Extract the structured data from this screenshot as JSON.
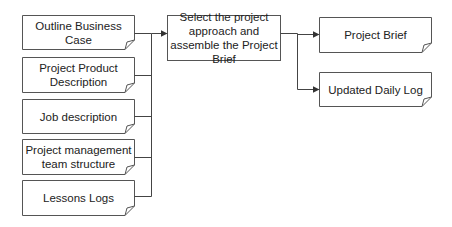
{
  "diagram": {
    "inputs": [
      {
        "label": "Outline Business Case"
      },
      {
        "label": "Project Product Description"
      },
      {
        "label": "Job description"
      },
      {
        "label": "Project management team structure"
      },
      {
        "label": "Lessons Logs"
      }
    ],
    "process": {
      "label": "Select the project approach and assemble the Project Brief"
    },
    "outputs": [
      {
        "label": "Project Brief"
      },
      {
        "label": "Updated Daily Log"
      }
    ],
    "colors": {
      "line": "#444444",
      "box_fill": "#ffffff",
      "text": "#222222"
    }
  }
}
